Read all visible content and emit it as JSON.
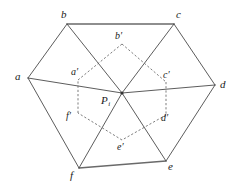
{
  "figure": {
    "type": "geometry-diagram",
    "background_color": "#ffffff",
    "solid_stroke_color": "#4a4a4a",
    "dashed_stroke_color": "#666666",
    "width": 238,
    "height": 193
  },
  "outer_hexagon": {
    "name": "outer-hexagon",
    "vertices": [
      {
        "id": "a",
        "label": "a",
        "x": 28,
        "y": 78,
        "label_x": 15,
        "label_y": 71
      },
      {
        "id": "b",
        "label": "b",
        "x": 67,
        "y": 24,
        "label_x": 61,
        "label_y": 9
      },
      {
        "id": "c",
        "label": "c",
        "x": 174,
        "y": 24,
        "label_x": 176,
        "label_y": 9
      },
      {
        "id": "d",
        "label": "d",
        "x": 215,
        "y": 85,
        "label_x": 220,
        "label_y": 79
      },
      {
        "id": "e",
        "label": "e",
        "x": 166,
        "y": 161,
        "label_x": 168,
        "label_y": 161
      },
      {
        "id": "f",
        "label": "f",
        "x": 79,
        "y": 168,
        "label_x": 70,
        "label_y": 170
      }
    ],
    "edges": [
      [
        "a",
        "b"
      ],
      [
        "b",
        "c"
      ],
      [
        "c",
        "d"
      ],
      [
        "d",
        "e"
      ],
      [
        "e",
        "f"
      ],
      [
        "f",
        "a"
      ]
    ]
  },
  "inner_hexagon": {
    "name": "inner-hexagon-dashed",
    "vertices": [
      {
        "id": "a_prime",
        "label": "a′",
        "x": 78,
        "y": 80,
        "label_x": 71,
        "label_y": 67
      },
      {
        "id": "b_prime",
        "label": "b′",
        "x": 122,
        "y": 44,
        "label_x": 115,
        "label_y": 31
      },
      {
        "id": "c_prime",
        "label": "c′",
        "x": 166,
        "y": 82,
        "label_x": 163,
        "label_y": 70
      },
      {
        "id": "d_prime",
        "label": "d′",
        "x": 166,
        "y": 115,
        "label_x": 161,
        "label_y": 113
      },
      {
        "id": "e_prime",
        "label": "e′",
        "x": 122,
        "y": 140,
        "label_x": 117,
        "label_y": 142
      },
      {
        "id": "f_prime",
        "label": "f′",
        "x": 78,
        "y": 113,
        "label_x": 66,
        "label_y": 111
      }
    ],
    "edges": [
      [
        "a_prime",
        "b_prime"
      ],
      [
        "b_prime",
        "c_prime"
      ],
      [
        "c_prime",
        "d_prime"
      ],
      [
        "d_prime",
        "e_prime"
      ],
      [
        "e_prime",
        "f_prime"
      ],
      [
        "f_prime",
        "a_prime"
      ]
    ]
  },
  "center": {
    "name": "center-point",
    "id": "P_i",
    "label_main": "P",
    "label_sub": "i",
    "x": 122,
    "y": 93,
    "label_x": 101,
    "label_y": 95
  },
  "spokes": {
    "name": "spokes-to-center",
    "from_vertices": [
      "a",
      "b",
      "c",
      "d",
      "e",
      "f"
    ]
  }
}
